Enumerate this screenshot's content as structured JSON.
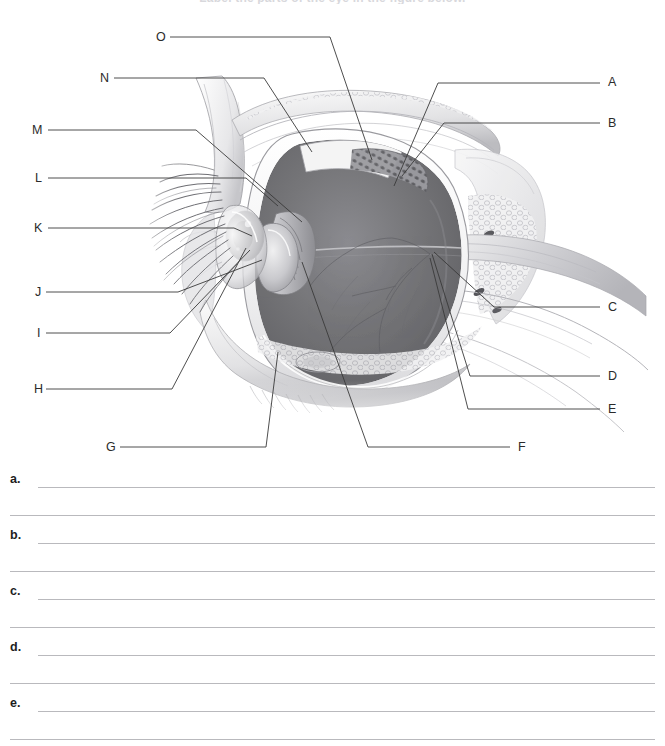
{
  "page": {
    "clipped_heading": "Label the parts of the eye in the figure below.",
    "background_color": "#ffffff",
    "width": 665,
    "height": 746
  },
  "figure": {
    "name": "sagittal-section-of-the-eye-and-orbit",
    "line_color": "#3a3a3a",
    "labels": [
      {
        "id": "A",
        "text": "A",
        "x": 608,
        "y": 76,
        "side": "right"
      },
      {
        "id": "B",
        "text": "B",
        "x": 608,
        "y": 117,
        "side": "right"
      },
      {
        "id": "C",
        "text": "C",
        "x": 608,
        "y": 301,
        "side": "right"
      },
      {
        "id": "D",
        "text": "D",
        "x": 608,
        "y": 370,
        "side": "right"
      },
      {
        "id": "E",
        "text": "E",
        "x": 608,
        "y": 403,
        "side": "right"
      },
      {
        "id": "F",
        "text": "F",
        "x": 518,
        "y": 441,
        "side": "bottom"
      },
      {
        "id": "G",
        "text": "G",
        "x": 106,
        "y": 441,
        "side": "bottom"
      },
      {
        "id": "H",
        "text": "H",
        "x": 34,
        "y": 383,
        "side": "left"
      },
      {
        "id": "I",
        "text": "I",
        "x": 37,
        "y": 327,
        "side": "left"
      },
      {
        "id": "J",
        "text": "J",
        "x": 35,
        "y": 286,
        "side": "left"
      },
      {
        "id": "K",
        "text": "K",
        "x": 34,
        "y": 222,
        "side": "left"
      },
      {
        "id": "L",
        "text": "L",
        "x": 35,
        "y": 172,
        "side": "left"
      },
      {
        "id": "M",
        "text": "M",
        "x": 32,
        "y": 124,
        "side": "left"
      },
      {
        "id": "N",
        "text": "N",
        "x": 100,
        "y": 72,
        "side": "left"
      },
      {
        "id": "O",
        "text": "O",
        "x": 156,
        "y": 31,
        "side": "left"
      }
    ]
  },
  "answers": {
    "items": [
      {
        "letter": "a."
      },
      {
        "letter": "b."
      },
      {
        "letter": "c."
      },
      {
        "letter": "d."
      },
      {
        "letter": "e."
      }
    ],
    "lines_per_item": 2,
    "rule_color": "#b9b9bd"
  }
}
